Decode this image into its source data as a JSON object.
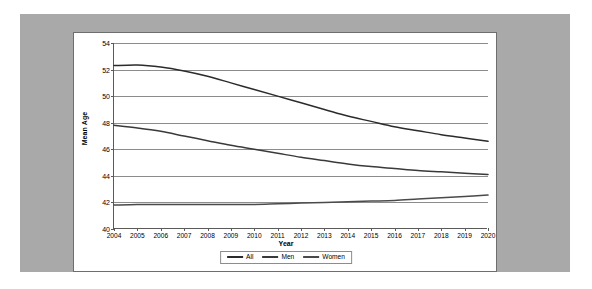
{
  "page": {
    "background_color": "#ffffff",
    "panel_color": "#a9a9a9",
    "card_color": "#ffffff",
    "card_border_color": "#6e6e6e"
  },
  "chart_data": {
    "type": "line",
    "title": "",
    "xlabel": "Year",
    "ylabel": "Mean Age",
    "x": [
      2004,
      2005,
      2006,
      2007,
      2008,
      2009,
      2010,
      2011,
      2012,
      2013,
      2014,
      2015,
      2016,
      2017,
      2018,
      2019,
      2020
    ],
    "categories": [
      "2004",
      "2005",
      "2006",
      "2007",
      "2008",
      "2009",
      "2010",
      "2011",
      "2012",
      "2013",
      "2014",
      "2015",
      "2016",
      "2017",
      "2018",
      "2019",
      "2020"
    ],
    "xlim": [
      2004,
      2020
    ],
    "ylim": [
      40,
      54
    ],
    "yticks": [
      40,
      42,
      44,
      46,
      48,
      50,
      52,
      54
    ],
    "ytick_labels": [
      "40",
      "42",
      "44",
      "46",
      "48",
      "50",
      "52",
      "54"
    ],
    "grid": "horizontal",
    "legend_position": "bottom-center",
    "series": [
      {
        "name": "All",
        "color": "#2b2b2b",
        "values": [
          52.3,
          52.35,
          52.2,
          51.9,
          51.5,
          51.0,
          50.5,
          50.0,
          49.5,
          49.0,
          48.5,
          48.1,
          47.7,
          47.4,
          47.1,
          46.85,
          46.6
        ]
      },
      {
        "name": "Men",
        "color": "#3a3a3a",
        "values": [
          47.8,
          47.6,
          47.35,
          47.0,
          46.65,
          46.3,
          46.0,
          45.7,
          45.4,
          45.15,
          44.9,
          44.7,
          44.55,
          44.4,
          44.3,
          44.2,
          44.1
        ]
      },
      {
        "name": "Women",
        "color": "#4a4a4a",
        "values": [
          41.8,
          41.85,
          41.85,
          41.85,
          41.85,
          41.85,
          41.85,
          41.9,
          41.95,
          42.0,
          42.05,
          42.1,
          42.15,
          42.25,
          42.35,
          42.45,
          42.55
        ]
      }
    ]
  },
  "legend": {
    "entries": [
      {
        "label": "All"
      },
      {
        "label": "Men"
      },
      {
        "label": "Women"
      }
    ]
  }
}
